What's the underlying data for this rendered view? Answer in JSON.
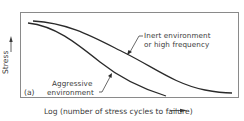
{
  "figure": {
    "panel_label": "(a)",
    "y_axis_label": "Stress",
    "x_axis_label": "Log (number of stress cycles to failure)",
    "curves": [
      {
        "name": "inert",
        "label_line1": "Inert environment",
        "label_line2": "or high frequency"
      },
      {
        "name": "aggressive",
        "label_line1": "Aggressive",
        "label_line2": "environment"
      }
    ],
    "colors": {
      "frame": "#8a8a8a",
      "curve": "#2a2a2a",
      "text": "#3a3a3a"
    }
  }
}
